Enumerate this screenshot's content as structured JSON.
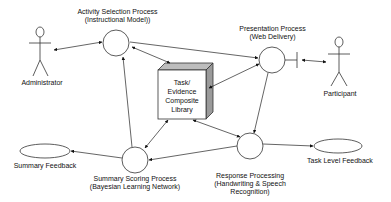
{
  "diagram": {
    "actors": {
      "administrator": {
        "label": "Administrator"
      },
      "participant": {
        "label": "Participant"
      }
    },
    "processes": {
      "activity_selection": {
        "line1": "Activity Selection Process",
        "line2": "(Instructional Model))"
      },
      "presentation": {
        "line1": "Presentation Process",
        "line2": "(Web Delivery)"
      },
      "summary_scoring": {
        "line1": "Summary Scoring Process",
        "line2": "(Bayesian Learning Network)"
      },
      "response_processing": {
        "line1": "Response Processing",
        "line2": "(Handwriting & Speech",
        "line3": "Recognition)"
      }
    },
    "library": {
      "line1": "Task/",
      "line2": "Evidence",
      "line3": "Composite",
      "line4": "Library"
    },
    "outputs": {
      "summary_feedback": {
        "label": "Summary Feedback"
      },
      "task_level_feedback": {
        "label": "Task Level Feedback"
      }
    },
    "colors": {
      "stroke": "#222222",
      "box_top": "#bdbdbd",
      "box_side": "#9a9a9a",
      "box_front": "#ffffff"
    }
  }
}
